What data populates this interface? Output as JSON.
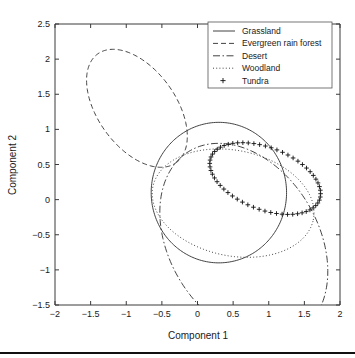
{
  "figure": {
    "kind": "scatter-ellipse-plot",
    "background": "#ffffff",
    "foreground": "#2e2e2e"
  },
  "axes": {
    "xlabel": "Component 1",
    "ylabel": "Component 2",
    "xticks": [
      "-2",
      "-1.5",
      "-1",
      "-0.5",
      "0",
      "0.5",
      "1",
      "1.5",
      "2"
    ],
    "yticks": [
      "-1.5",
      "-1",
      "-0.5",
      "0",
      "0.5",
      "1",
      "1.5",
      "2",
      "2.5"
    ],
    "xlim": [
      -2,
      2
    ],
    "ylim": [
      -1.5,
      2.5
    ]
  },
  "legend": {
    "position": "top-right",
    "entries": [
      {
        "label": "Grassland",
        "style": "solid",
        "marker": "none"
      },
      {
        "label": "Evergreen rain forest",
        "style": "dashed",
        "marker": "none"
      },
      {
        "label": "Desert",
        "style": "dashdot",
        "marker": "none"
      },
      {
        "label": "Woodland",
        "style": "dotted",
        "marker": "none"
      },
      {
        "label": "Tundra",
        "style": "none",
        "marker": "plus"
      }
    ]
  },
  "chart_data": {
    "type": "scatter",
    "title": "",
    "xlabel": "Component 1",
    "ylabel": "Component 2",
    "xlim": [
      -2,
      2
    ],
    "ylim": [
      -1.5,
      2.5
    ],
    "grid": false,
    "legend_position": "top-right",
    "series": [
      {
        "name": "Grassland",
        "style": "solid",
        "shape": "ellipse",
        "center": [
          0.3,
          0.1
        ],
        "radii": [
          0.95,
          1.0
        ],
        "rotation_deg": 0
      },
      {
        "name": "Evergreen rain forest",
        "style": "dashed",
        "shape": "ellipse",
        "center": [
          -0.85,
          1.3
        ],
        "radii": [
          0.95,
          0.55
        ],
        "rotation_deg": -55
      },
      {
        "name": "Desert",
        "style": "dashdot",
        "shape": "ellipse",
        "center": [
          0.65,
          -0.6
        ],
        "radii": [
          1.5,
          1.05
        ],
        "rotation_deg": -60
      },
      {
        "name": "Woodland",
        "style": "dotted",
        "shape": "ellipse",
        "center": [
          0.5,
          -0.05
        ],
        "radii": [
          1.15,
          0.75
        ],
        "rotation_deg": -12
      },
      {
        "name": "Tundra",
        "style": "none",
        "marker": "plus",
        "shape": "ellipse",
        "center": [
          0.95,
          0.3
        ],
        "radii": [
          0.82,
          0.44
        ],
        "rotation_deg": -22,
        "n_markers": 60
      }
    ]
  }
}
